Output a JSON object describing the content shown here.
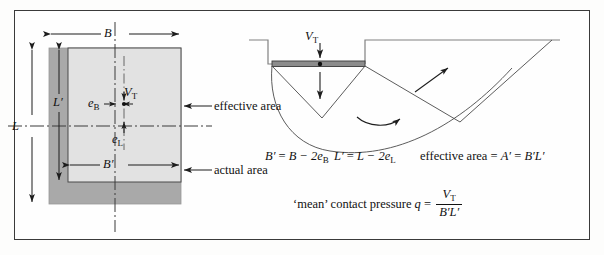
{
  "figure": {
    "caption_present": false,
    "views": {
      "plan": {
        "name": "plan-view-eccentric-footing",
        "areas": {
          "actual_label": "actual area",
          "effective_label": "effective area"
        },
        "dimensions": {
          "B": "B",
          "B_prime": "B′",
          "L": "L",
          "L_prime": "L′",
          "e_B_base": "e",
          "e_B_sub": "B",
          "e_L_base": "e",
          "e_L_sub": "L"
        },
        "load": {
          "base": "V",
          "sub": "T"
        }
      },
      "section": {
        "name": "section-view-bearing-failure",
        "load": {
          "base": "V",
          "sub": "T"
        }
      }
    },
    "equations": {
      "b_prime": {
        "lhs_base": "B′",
        "eq": " = ",
        "rhs": "B − 2e",
        "rhs_sub": "B"
      },
      "l_prime": {
        "lhs_base": "L′",
        "eq": " = ",
        "rhs": "L − 2e",
        "rhs_sub": "L"
      },
      "effective_area": {
        "text": "effective area = ",
        "a_prime": "A′",
        "eq": " = ",
        "product": "B′L′"
      },
      "mean_pressure": {
        "prefix": "‘mean’ contact pressure ",
        "q": "q",
        "eq": " = ",
        "numerator_base": "V",
        "numerator_sub": "T",
        "denominator": "B′L′"
      }
    },
    "colors": {
      "actual_area_fill": "#a9a9a9",
      "effective_area_fill": "#e2e2e2",
      "footing_fill": "#8c8c8c",
      "line": "#2b2b2b",
      "ground_line": "#808080",
      "border": "#3a3a3a",
      "page_background": "#fefefe"
    }
  }
}
